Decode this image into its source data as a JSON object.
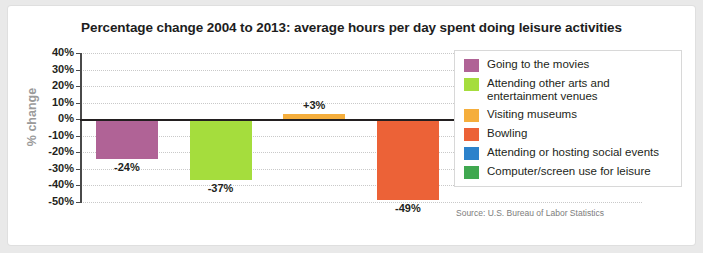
{
  "chart_data": {
    "type": "bar",
    "title": "Percentage change 2004 to 2013: average hours per day spent doing leisure activities",
    "xlabel": "",
    "ylabel": "% change",
    "ylim": [
      -50,
      40
    ],
    "ytick_labels": [
      "40%",
      "30%",
      "20%",
      "10%",
      "0%",
      "-10%",
      "-20%",
      "-30%",
      "-40%",
      "-50%"
    ],
    "ytick_values": [
      40,
      30,
      20,
      10,
      0,
      -10,
      -20,
      -30,
      -40,
      -50
    ],
    "grid": true,
    "legend_position": "right",
    "categories": [
      "Going to the movies",
      "Attending other arts and entertainment venues",
      "Visiting museums",
      "Bowling",
      "Attending or hosting social events",
      "Computer/screen use for leisure"
    ],
    "values": [
      -24,
      -37,
      3,
      -49,
      -29,
      30
    ],
    "data_labels": [
      "-24%",
      "-37%",
      "+3%",
      "-49%",
      "-29%",
      "+30%"
    ],
    "colors": [
      "#b06396",
      "#a5dd3d",
      "#f5ae3c",
      "#ec6237",
      "#2c82cb",
      "#40a850"
    ],
    "source": "Source: U.S. Bureau of Labor Statistics"
  },
  "legend": {
    "items": [
      {
        "label": "Going to the movies",
        "color": "#b06396"
      },
      {
        "label": "Attending other arts and entertainment venues",
        "color": "#a5dd3d"
      },
      {
        "label": "Visiting museums",
        "color": "#f5ae3c"
      },
      {
        "label": "Bowling",
        "color": "#ec6237"
      },
      {
        "label": "Attending or hosting social events",
        "color": "#2c82cb"
      },
      {
        "label": "Computer/screen use for leisure",
        "color": "#40a850"
      }
    ]
  }
}
